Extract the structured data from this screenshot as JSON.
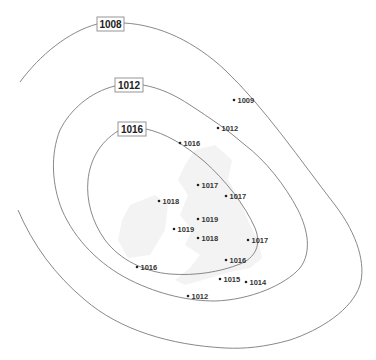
{
  "isobars": [
    {
      "value": "1008",
      "label": "1008"
    },
    {
      "value": "1012",
      "label": "1012"
    },
    {
      "value": "1016",
      "label": "1016"
    }
  ],
  "stations": [
    {
      "value": "1009"
    },
    {
      "value": "1012"
    },
    {
      "value": "1016"
    },
    {
      "value": "1017"
    },
    {
      "value": "1017"
    },
    {
      "value": "1018"
    },
    {
      "value": "1019"
    },
    {
      "value": "1019"
    },
    {
      "value": "1018"
    },
    {
      "value": "1017"
    },
    {
      "value": "1016"
    },
    {
      "value": "1016"
    },
    {
      "value": "1015"
    },
    {
      "value": "1014"
    },
    {
      "value": "1012"
    }
  ],
  "colors": {
    "isobar_line": "#7a7a7a",
    "land": "#f3f3f3",
    "text": "#222222"
  }
}
